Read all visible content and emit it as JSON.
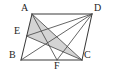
{
  "figure": {
    "shape_name": "parallelogram",
    "stroke_color": "#3a3a3a",
    "shade_color": "#b9b9b9",
    "background_color": "#ffffff",
    "vertices": [
      {
        "id": "A",
        "label": "A",
        "x": 32,
        "y": 14,
        "label_x": 21,
        "label_y": 3,
        "on": "parallelogram-corner-top-left"
      },
      {
        "id": "D",
        "label": "D",
        "x": 92,
        "y": 14,
        "label_x": 94,
        "label_y": 3,
        "on": "parallelogram-corner-top-right"
      },
      {
        "id": "B",
        "label": "B",
        "x": 21,
        "y": 60,
        "label_x": 9,
        "label_y": 50,
        "on": "parallelogram-corner-bottom-left"
      },
      {
        "id": "C",
        "label": "C",
        "x": 82,
        "y": 60,
        "label_x": 84,
        "label_y": 50,
        "on": "parallelogram-corner-bottom-right"
      },
      {
        "id": "E",
        "label": "E",
        "x": 26.5,
        "y": 36,
        "label_x": 14,
        "label_y": 26,
        "on": "side-AB"
      },
      {
        "id": "F",
        "label": "F",
        "x": 57,
        "y": 60,
        "label_x": 54,
        "label_y": 61,
        "on": "side-BC"
      }
    ],
    "outline_edges": [
      {
        "name": "edge-AD",
        "from": "A",
        "to": "D"
      },
      {
        "name": "edge-DC",
        "from": "D",
        "to": "C"
      },
      {
        "name": "edge-CB",
        "from": "C",
        "to": "B"
      },
      {
        "name": "edge-BA",
        "from": "B",
        "to": "A"
      }
    ],
    "inner_segments": [
      {
        "name": "segment-AC",
        "from": "A",
        "to": "C"
      },
      {
        "name": "segment-AF",
        "from": "A",
        "to": "F"
      },
      {
        "name": "segment-ED",
        "from": "E",
        "to": "D"
      },
      {
        "name": "segment-EC",
        "from": "E",
        "to": "C"
      },
      {
        "name": "segment-BD",
        "from": "B",
        "to": "D"
      },
      {
        "name": "segment-DF",
        "from": "D",
        "to": "F"
      }
    ],
    "shaded_polygons": [
      {
        "name": "shaded-triangle-AEC",
        "points": "A,E,C"
      }
    ]
  }
}
